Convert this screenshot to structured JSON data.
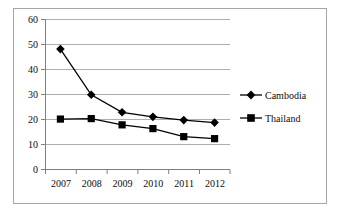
{
  "chart_data": {
    "type": "line",
    "title": "",
    "subtitle": "",
    "xlabel": "",
    "ylabel": "",
    "categories": [
      "2007",
      "2008",
      "2009",
      "2010",
      "2011",
      "2012"
    ],
    "series": [
      {
        "name": "Cambodia",
        "marker": "diamond",
        "color": "#000000",
        "values": [
          48.0,
          29.8,
          22.8,
          21.0,
          19.7,
          18.7
        ]
      },
      {
        "name": "Thailand",
        "marker": "square",
        "color": "#000000",
        "values": [
          20.1,
          20.3,
          17.8,
          16.3,
          13.1,
          12.3
        ]
      }
    ],
    "ylim": [
      0,
      60
    ],
    "yticks": [
      0,
      10,
      20,
      30,
      40,
      50,
      60
    ],
    "ytick_labels": [
      "0",
      "10",
      "20",
      "30",
      "40",
      "50",
      "60"
    ],
    "xtick_labels": [
      "2007",
      "2008",
      "2009",
      "2010",
      "2011",
      "2012"
    ],
    "grid": {
      "horizontal": true,
      "vertical": false,
      "color": "#aeaeae"
    },
    "legend": {
      "position": "right",
      "entries": [
        "Cambodia",
        "Thailand"
      ]
    },
    "axis_color": "#808080",
    "plot_background": "#ffffff",
    "frame_color": "#a6a6a6"
  },
  "axis": {
    "y_labels": [
      "60",
      "50",
      "40",
      "30",
      "20",
      "10",
      "0"
    ],
    "x_labels": [
      "2007",
      "2008",
      "2009",
      "2010",
      "2011",
      "2012"
    ]
  },
  "legend": {
    "cambodia": "Cambodia",
    "thailand": "Thailand"
  }
}
